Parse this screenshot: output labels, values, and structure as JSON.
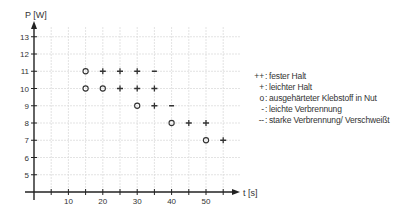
{
  "chart_data": {
    "type": "scatter",
    "title": "",
    "xlabel": "t [s]",
    "ylabel": "P [W]",
    "xlim": [
      0,
      57
    ],
    "ylim": [
      4,
      14
    ],
    "x_ticks": [
      5,
      10,
      15,
      20,
      25,
      30,
      35,
      40,
      45,
      50,
      55
    ],
    "x_tick_labels": [
      "",
      "10",
      "",
      "20",
      "",
      "30",
      "",
      "40",
      "",
      "50",
      ""
    ],
    "y_ticks": [
      5,
      6,
      7,
      8,
      9,
      10,
      11,
      12,
      13
    ],
    "y_tick_labels": [
      "5",
      "6",
      "7",
      "8",
      "9",
      "10",
      "11",
      "12",
      "13"
    ],
    "grid": true,
    "legend_position": "right",
    "legend": [
      {
        "symbol": "++",
        "label": "fester Halt"
      },
      {
        "symbol": "+",
        "label": "leichter Halt"
      },
      {
        "symbol": "o",
        "label": "ausgehärteter Klebstoff in Nut"
      },
      {
        "symbol": "-",
        "label": "leichte Verbrennung"
      },
      {
        "symbol": "--",
        "label": "starke Verbrennung/ Verschweißt"
      }
    ],
    "points": [
      {
        "t": 15,
        "P": 11,
        "symbol": "o"
      },
      {
        "t": 20,
        "P": 11,
        "symbol": "+"
      },
      {
        "t": 25,
        "P": 11,
        "symbol": "+"
      },
      {
        "t": 30,
        "P": 11,
        "symbol": "+"
      },
      {
        "t": 35,
        "P": 11,
        "symbol": "-"
      },
      {
        "t": 15,
        "P": 10,
        "symbol": "o"
      },
      {
        "t": 20,
        "P": 10,
        "symbol": "o"
      },
      {
        "t": 25,
        "P": 10,
        "symbol": "+"
      },
      {
        "t": 30,
        "P": 10,
        "symbol": "+"
      },
      {
        "t": 35,
        "P": 10,
        "symbol": "+"
      },
      {
        "t": 30,
        "P": 9,
        "symbol": "o"
      },
      {
        "t": 35,
        "P": 9,
        "symbol": "+"
      },
      {
        "t": 40,
        "P": 9,
        "symbol": "-"
      },
      {
        "t": 40,
        "P": 8,
        "symbol": "o"
      },
      {
        "t": 45,
        "P": 8,
        "symbol": "+"
      },
      {
        "t": 50,
        "P": 8,
        "symbol": "+"
      },
      {
        "t": 50,
        "P": 7,
        "symbol": "o"
      },
      {
        "t": 55,
        "P": 7,
        "symbol": "+"
      }
    ]
  },
  "colors": {
    "axis": "#222222",
    "grid": "#dcdcdc",
    "marker": "#333333",
    "text": "#333333"
  }
}
